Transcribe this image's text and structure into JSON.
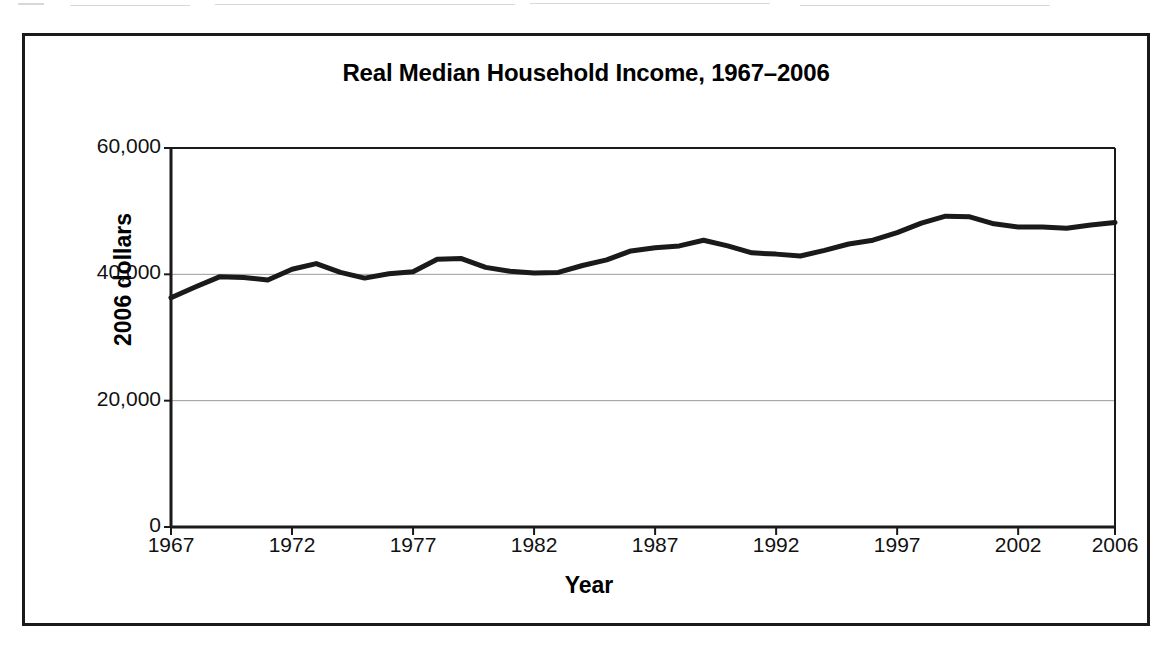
{
  "figure": {
    "title": "Real Median Household Income, 1967–2006"
  },
  "chart_data": {
    "type": "line",
    "title": "Real Median Household Income, 1967–2006",
    "xlabel": "Year",
    "ylabel": "2006 dollars",
    "xlim": [
      1967,
      2006
    ],
    "ylim": [
      0,
      60000
    ],
    "grid": true,
    "legend": "none",
    "y_ticks": [
      0,
      20000,
      40000,
      60000
    ],
    "y_tick_labels": [
      "0",
      "20,000",
      "40,000",
      "60,000"
    ],
    "x_ticks": [
      1967,
      1972,
      1977,
      1982,
      1987,
      1992,
      1997,
      2002,
      2006
    ],
    "x_tick_labels": [
      "1967",
      "1972",
      "1977",
      "1982",
      "1987",
      "1992",
      "1997",
      "2002",
      "2006"
    ],
    "series": [
      {
        "name": "Real median household income",
        "color": "#1a1a1a",
        "x": [
          1967,
          1968,
          1969,
          1970,
          1971,
          1972,
          1973,
          1974,
          1975,
          1976,
          1977,
          1978,
          1979,
          1980,
          1981,
          1982,
          1983,
          1984,
          1985,
          1986,
          1987,
          1988,
          1989,
          1990,
          1991,
          1992,
          1993,
          1994,
          1995,
          1996,
          1997,
          1998,
          1999,
          2000,
          2001,
          2002,
          2003,
          2004,
          2005,
          2006
        ],
        "values": [
          36300,
          38000,
          39600,
          39500,
          39100,
          40800,
          41700,
          40300,
          39400,
          40100,
          40400,
          42400,
          42500,
          41100,
          40500,
          40200,
          40300,
          41400,
          42300,
          43700,
          44200,
          44500,
          45400,
          44500,
          43400,
          43200,
          42900,
          43800,
          44800,
          45400,
          46600,
          48100,
          49200,
          49100,
          48000,
          47500,
          47500,
          47300,
          47800,
          48200
        ]
      }
    ]
  },
  "axes": {
    "y_title": "2006 dollars",
    "x_title": "Year"
  }
}
